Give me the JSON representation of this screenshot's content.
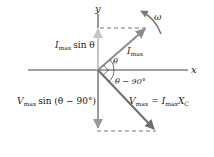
{
  "diagram": {
    "type": "phasor-diagram",
    "axes": {
      "x_label": "x",
      "y_label": "y"
    },
    "phasors": [
      {
        "name": "current",
        "label_var": "I",
        "label_sub": "max",
        "angle_label": "θ"
      },
      {
        "name": "voltage",
        "label_var": "V",
        "label_sub": "max",
        "equation_eq": "=",
        "equation_rhs_var": "I",
        "equation_rhs_sub": "max",
        "equation_rhs_var2": "X",
        "equation_rhs_sub2": "C",
        "angle_label": "θ − 90°"
      }
    ],
    "projections": {
      "current": {
        "var": "I",
        "sub": "max",
        "func": "sin θ"
      },
      "voltage": {
        "var": "V",
        "sub": "max",
        "func": "sin (θ − 90°)"
      }
    },
    "rotation": {
      "label": "ω"
    },
    "colors": {
      "axis": "#444444",
      "phasor_current": "#8c8c8c",
      "phasor_voltage": "#6e6e6e",
      "projection_current": "#c4c4c4",
      "projection_voltage": "#9a9a9a",
      "dashed": "#555555"
    }
  }
}
